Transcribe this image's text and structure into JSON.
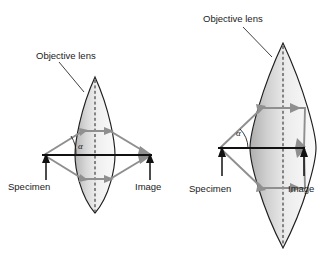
{
  "figure": {
    "width": 329,
    "height": 264,
    "background": "#ffffff",
    "type": "optics-diagram"
  },
  "colors": {
    "ray": "#8f8f8f",
    "outline": "#1f1f1f",
    "axis": "#111111",
    "text": "#1a1a1a",
    "lens_fill_light": "#f2f2f2",
    "lens_fill_dark": "#b8b8b8"
  },
  "panels": [
    {
      "id": "left",
      "name": "low-numerical-aperture",
      "lens_label": "Objective lens",
      "specimen_label": "Specimen",
      "image_label": "Image",
      "angle_label": "α",
      "angle_degrees": 18,
      "lens_tip_top_y": 77,
      "lens_tip_bottom_y": 213,
      "lens_center_x": 95,
      "lens_half_width": 20,
      "axis_left_x": 42,
      "axis_right_x": 152,
      "axis_y": 155
    },
    {
      "id": "right",
      "name": "high-numerical-aperture",
      "lens_label": "Objective lens",
      "specimen_label": "Specimen",
      "image_label": "Image",
      "angle_label": "α",
      "angle_degrees": 42,
      "lens_tip_top_y": 43,
      "lens_tip_bottom_y": 248,
      "lens_center_x": 283,
      "lens_half_width": 33,
      "axis_left_x": 218,
      "axis_right_x": 305,
      "axis_y": 148
    }
  ]
}
